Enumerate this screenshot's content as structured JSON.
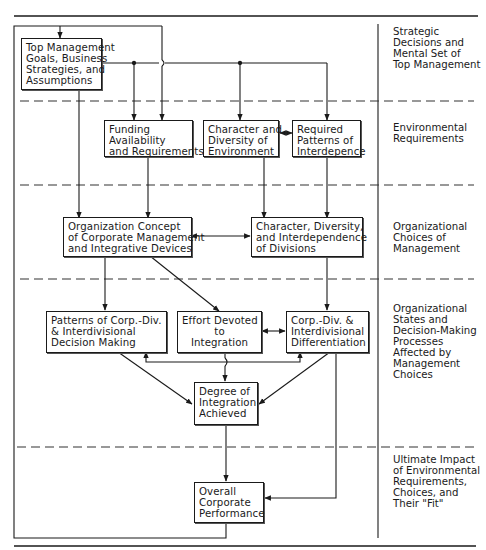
{
  "boxes": {
    "top_mgmt": [
      "Top Management",
      "Goals, Business",
      "Strategies, and",
      "Assumptions"
    ],
    "funding": [
      "Funding",
      "Availability",
      "and Requirements"
    ],
    "character_env": [
      "Character and",
      "Diversity of",
      "Environment"
    ],
    "required_patterns": [
      "Required",
      "Patterns of",
      "Interdepence"
    ],
    "org_concept": [
      "Organization Concept",
      "of Corporate Management",
      "and Integrative Devices"
    ],
    "char_divisions": [
      "Character, Diversity,",
      "and Interdependence",
      "of Divisions"
    ],
    "patterns_decision": [
      "Patterns of Corp.-Div.",
      "& Interdivisional",
      "Decision Making"
    ],
    "effort_integration": [
      "Effort Devoted",
      "to",
      "Integration"
    ],
    "differentiation": [
      "Corp.-Div. &",
      "Interdivisional",
      "Differentiation"
    ],
    "degree_integration": [
      "Degree of",
      "Integration",
      "Achieved"
    ],
    "overall_performance": [
      "Overall",
      "Corporate",
      "Performance"
    ]
  },
  "levels": {
    "strategic": [
      "Strategic",
      "Decisions and",
      "Mental Set of",
      "Top Management"
    ],
    "environmental": [
      "Environmental",
      "Requirements"
    ],
    "organizational_choices": [
      "Organizational",
      "Choices of",
      "Management"
    ],
    "organizational_states": [
      "Organizational",
      "States and",
      "Decision-Making",
      "Processes",
      "Affected by",
      "Management",
      "Choices"
    ],
    "ultimate_impact": [
      "Ultimate Impact",
      "of Environmental",
      "Requirements,",
      "Choices, and",
      "Their \"Fit\""
    ]
  },
  "colors": {
    "ink": "#1a1a1a",
    "dash": "#333333"
  }
}
